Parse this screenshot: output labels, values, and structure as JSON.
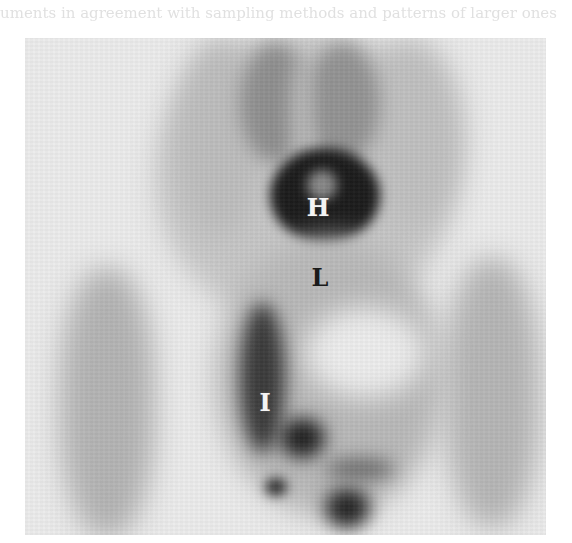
{
  "image": {
    "type": "scintigraphy-scan",
    "colormap": "inverted-grayscale",
    "background_color": "#ffffff",
    "frame_color": "#ececec",
    "bleed_text": "uments in agreement with sampling methods and patterns of larger ones"
  },
  "labels": [
    {
      "id": "H",
      "text": "H",
      "tone": "light",
      "x": 318,
      "y": 208
    },
    {
      "id": "L",
      "text": "L",
      "tone": "dark",
      "x": 320,
      "y": 278
    },
    {
      "id": "I",
      "text": "I",
      "tone": "light",
      "x": 265,
      "y": 403
    }
  ]
}
